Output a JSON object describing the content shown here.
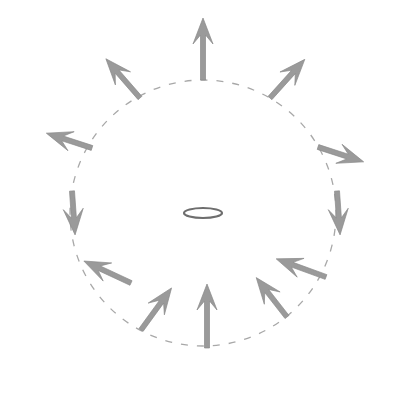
{
  "figure": {
    "title": "",
    "caption": "",
    "background_color": "#ffffff",
    "width": 395,
    "height": 394
  },
  "chart_data": {
    "type": "scatter",
    "title": "",
    "subtitle": "",
    "xlabel": "",
    "ylabel": "",
    "grid": false,
    "legend_position": "none",
    "annotations": [],
    "center": {
      "x": 203,
      "y": 213
    },
    "circle": {
      "radius": 133,
      "stroke_color": "#a8a8a8",
      "stroke_width": 1.3,
      "dash_pattern": "7 9",
      "filled": false
    },
    "ring": {
      "center_x": 203,
      "center_y": 213,
      "radius_x": 19,
      "radius_y": 5,
      "stroke_color": "#6e6e6e",
      "stroke_width": 2.2,
      "fill": "#ffffff"
    },
    "arrow_style": {
      "fill_color": "#9a9a9a",
      "stroke_color": "#8a8a8a",
      "shaft_width": 5,
      "head_length": 26,
      "head_half_width": 10,
      "barb_inset": 9
    },
    "series": [
      {
        "name": "field vectors",
        "points": [
          {
            "label": "12 o'clock",
            "angle_deg": 90,
            "base_x": 203,
            "base_y": 80,
            "direction_deg": 90,
            "length": 62
          },
          {
            "label": "1 o'clock",
            "angle_deg": 60,
            "base_x": 270,
            "base_y": 98,
            "direction_deg": 48,
            "length": 52
          },
          {
            "label": "2 o'clock",
            "angle_deg": 30,
            "base_x": 318,
            "base_y": 147,
            "direction_deg": -18,
            "length": 48
          },
          {
            "label": "3 o'clock",
            "angle_deg": 0,
            "base_x": 337,
            "base_y": 191,
            "direction_deg": -86,
            "length": 44
          },
          {
            "label": "4 o'clock",
            "angle_deg": -30,
            "base_x": 326,
            "base_y": 277,
            "direction_deg": 160,
            "length": 53
          },
          {
            "label": "5 o'clock",
            "angle_deg": -60,
            "base_x": 287,
            "base_y": 317,
            "direction_deg": 128,
            "length": 50
          },
          {
            "label": "6 o'clock",
            "angle_deg": -90,
            "base_x": 207,
            "base_y": 348,
            "direction_deg": 90,
            "length": 64
          },
          {
            "label": "7 o'clock",
            "angle_deg": -120,
            "base_x": 141,
            "base_y": 330,
            "direction_deg": 54,
            "length": 52
          },
          {
            "label": "8 o'clock",
            "angle_deg": -150,
            "base_x": 131,
            "base_y": 283,
            "direction_deg": 155,
            "length": 52
          },
          {
            "label": "9 o'clock",
            "angle_deg": 180,
            "base_x": 72,
            "base_y": 191,
            "direction_deg": -86,
            "length": 44
          },
          {
            "label": "10 o'clock",
            "angle_deg": 150,
            "base_x": 92,
            "base_y": 148,
            "direction_deg": 162,
            "length": 48
          },
          {
            "label": "11 o'clock",
            "angle_deg": 120,
            "base_x": 140,
            "base_y": 98,
            "direction_deg": 131,
            "length": 52
          }
        ]
      }
    ]
  }
}
